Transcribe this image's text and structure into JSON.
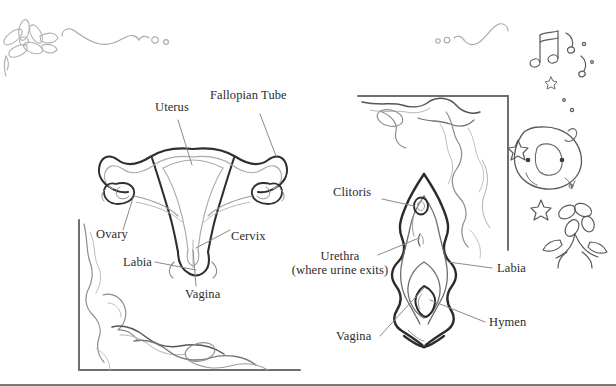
{
  "figure": {
    "background_color": "#ffffff",
    "ink_color": "#2b2b2b",
    "line_color_dark": "#3a3a3a",
    "line_color_light": "#b9b9b9",
    "border_color": "#7a7a7a"
  },
  "left_diagram": {
    "name": "internal-reproductive-organs",
    "labels": [
      {
        "id": "uterus",
        "text": "Uterus"
      },
      {
        "id": "fallopian-tube",
        "text": "Fallopian Tube"
      },
      {
        "id": "ovary",
        "text": "Ovary"
      },
      {
        "id": "cervix",
        "text": "Cervix"
      },
      {
        "id": "labia",
        "text": "Labia"
      },
      {
        "id": "vagina",
        "text": "Vagina"
      }
    ]
  },
  "right_diagram": {
    "name": "external-genitalia-vulva",
    "labels": [
      {
        "id": "clitoris",
        "text": "Clitoris"
      },
      {
        "id": "urethra",
        "text": "Urethra",
        "sub": "(where urine exits)"
      },
      {
        "id": "labia",
        "text": "Labia"
      },
      {
        "id": "hymen",
        "text": "Hymen"
      },
      {
        "id": "vagina",
        "text": "Vagina"
      }
    ]
  },
  "decorations": {
    "flower_top_left": "flower-icon",
    "flourish_left": "flourish-icon",
    "flourish_right": "flourish-icon",
    "blob_character": "blob-character-icon",
    "music_notes": "music-note-icon",
    "stars": "star-icon",
    "flower_right": "flower-icon",
    "corner_frame_bottom_left": "corner-frame-icon",
    "corner_frame_top_right": "corner-frame-icon"
  }
}
